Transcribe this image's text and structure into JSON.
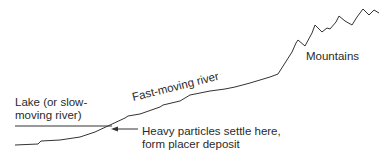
{
  "labels": {
    "lake_line1": "Lake (or slow-",
    "lake_line2": "moving river)",
    "river": "Fast-moving river",
    "mountains": "Mountains",
    "deposit_line1": "Heavy particles settle here,",
    "deposit_line2": "form placer deposit"
  },
  "colors": {
    "line": "#333333",
    "text": "#2a2a2a",
    "background": "#ffffff"
  }
}
